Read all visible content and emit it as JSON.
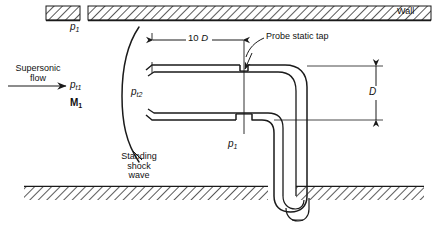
{
  "figure": {
    "type": "engineering-diagram",
    "background_color": "#ffffff",
    "line_color": "#1a1a1a",
    "hatch_color": "#222222"
  },
  "labels": {
    "wall": "Wall",
    "upstream_static_pressure": {
      "symbol": "p",
      "subscript": "1"
    },
    "flow_caption_line1": "Supersonic",
    "flow_caption_line2": "flow",
    "total_pressure_upstream": {
      "symbol": "p",
      "subscript": "t1"
    },
    "mach_upstream": {
      "symbol": "M",
      "subscript": "1"
    },
    "total_pressure_downstream": {
      "symbol": "p",
      "subscript": "t2"
    },
    "shock_line1": "Standing",
    "shock_line2": "shock",
    "shock_line3": "wave",
    "probe_static_tap": "Probe static tap",
    "probe_static_pressure": {
      "symbol": "p",
      "subscript": "1"
    }
  },
  "dimensions": {
    "length_to_tap": {
      "value": "10",
      "unit_symbol": "D",
      "text": "10 D"
    },
    "probe_diameter": {
      "symbol": "D",
      "text": "D"
    }
  },
  "icons": {
    "flow_arrow": "right-arrow-icon",
    "leader_tap": "curved-leader-icon",
    "leader_shock": "curved-leader-icon",
    "dim_arrow_left": "left-arrow-icon",
    "dim_arrow_right": "right-arrow-icon",
    "dim_arrow_up": "up-arrow-icon",
    "dim_arrow_down": "down-arrow-icon"
  }
}
